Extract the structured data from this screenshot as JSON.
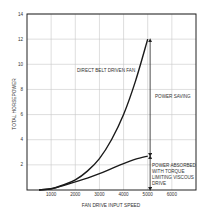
{
  "chart_data": {
    "type": "line",
    "title": "",
    "xlabel": "FAN DRIVE INPUT SPEED",
    "ylabel": "TOTAL HORSEPOWER",
    "xlim": [
      0,
      7000
    ],
    "ylim": [
      0,
      14
    ],
    "grid": true,
    "x_ticks": [
      1000,
      2000,
      3000,
      4000,
      5000,
      6000
    ],
    "y_ticks": [
      2,
      4,
      6,
      8,
      10,
      12,
      14
    ],
    "x_tick_labels": [
      "1000",
      "2000",
      "3000",
      "4000",
      "5000",
      "6000"
    ],
    "y_tick_labels": [
      "2",
      "4",
      "6",
      "8",
      "10",
      "12",
      "14"
    ],
    "series": [
      {
        "name": "DIRECT BELT DRIVEN FAN",
        "x": [
          500,
          1000,
          1500,
          2000,
          2500,
          3000,
          3500,
          4000,
          4500,
          5000
        ],
        "y": [
          0,
          0.1,
          0.4,
          0.8,
          1.5,
          2.5,
          4.0,
          6.0,
          8.7,
          12.0
        ]
      },
      {
        "name": "POWER ABSORBED WITH TORQUE LIMITING VISCOUS DRIVE",
        "x": [
          500,
          1000,
          1500,
          2000,
          2500,
          3000,
          3500,
          4000,
          4500,
          5000
        ],
        "y": [
          0,
          0.1,
          0.35,
          0.65,
          0.95,
          1.3,
          1.7,
          2.1,
          2.45,
          2.7
        ]
      }
    ],
    "annotations": [
      {
        "text": "DIRECT BELT DRIVEN FAN",
        "x": 3300,
        "y": 9.6
      },
      {
        "text": "POWER SAVING",
        "x": 5200,
        "y": 7.5,
        "arrow": {
          "x": 5100,
          "y_from": 12.0,
          "y_to": 2.7
        }
      },
      {
        "text": "POWER ABSORBED WITH TORQUE LIMITING VISCOUS DRIVE",
        "x": 5200,
        "y": 2.0,
        "arrow": {
          "x": 5100,
          "y_from": 2.7,
          "y_to": 0
        }
      }
    ]
  },
  "labels": {
    "belt_fan": "DIRECT BELT DRIVEN FAN",
    "power_saving": "POWER SAVING",
    "absorbed_lines": [
      "POWER ABSORBED",
      "WITH TORQUE",
      "LIMITING VISCOUS",
      "DRIVE"
    ]
  }
}
